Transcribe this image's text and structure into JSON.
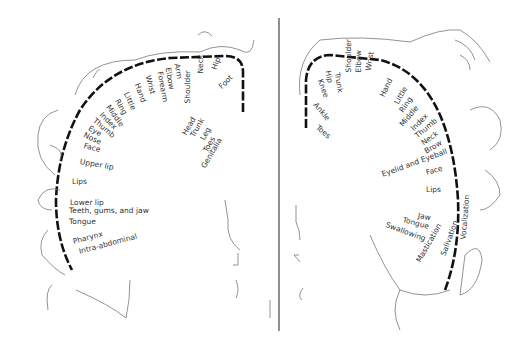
{
  "sensory": {
    "labels": [
      {
        "text": "Genitalia",
        "x": 203,
        "y": 168,
        "rot": -60
      },
      {
        "text": "Toes",
        "x": 205,
        "y": 152,
        "rot": -60
      },
      {
        "text": "Foot",
        "x": 220,
        "y": 88,
        "rot": -45
      },
      {
        "text": "Leg",
        "x": 202,
        "y": 140,
        "rot": -60
      },
      {
        "text": "Hip",
        "x": 214,
        "y": 70,
        "rot": -70
      },
      {
        "text": "Trunk",
        "x": 192,
        "y": 137,
        "rot": -60
      },
      {
        "text": "Neck",
        "x": 200,
        "y": 74,
        "rot": -90
      },
      {
        "text": "Head",
        "x": 184,
        "y": 135,
        "rot": -60
      },
      {
        "text": "Shoulder",
        "x": 187,
        "y": 104,
        "rot": -90
      },
      {
        "text": "Arm",
        "x": 177,
        "y": 64,
        "rot": 80
      },
      {
        "text": "Elbow",
        "x": 168,
        "y": 68,
        "rot": 80
      },
      {
        "text": "Forearm",
        "x": 160,
        "y": 72,
        "rot": 80
      },
      {
        "text": "Wrist",
        "x": 148,
        "y": 76,
        "rot": 75
      },
      {
        "text": "Hand",
        "x": 137,
        "y": 84,
        "rot": 70
      },
      {
        "text": "Little",
        "x": 126,
        "y": 93,
        "rot": 65
      },
      {
        "text": "Ring",
        "x": 117,
        "y": 100,
        "rot": 60
      },
      {
        "text": "Middle",
        "x": 108,
        "y": 106,
        "rot": 55
      },
      {
        "text": "Index",
        "x": 101,
        "y": 114,
        "rot": 45
      },
      {
        "text": "Thumb",
        "x": 94,
        "y": 120,
        "rot": 40
      },
      {
        "text": "Eye",
        "x": 89,
        "y": 128,
        "rot": 30
      },
      {
        "text": "Nose",
        "x": 84,
        "y": 135,
        "rot": 25
      },
      {
        "text": "Face",
        "x": 84,
        "y": 146,
        "rot": 15
      },
      {
        "text": "Upper lip",
        "x": 80,
        "y": 162,
        "rot": 10
      },
      {
        "text": "Lips",
        "x": 72,
        "y": 182,
        "rot": 0
      },
      {
        "text": "Lower lip",
        "x": 70,
        "y": 203,
        "rot": 0
      },
      {
        "text": "Teeth, gums, and jaw",
        "x": 69,
        "y": 211,
        "rot": 0
      },
      {
        "text": "Tongue",
        "x": 69,
        "y": 222,
        "rot": 0
      },
      {
        "text": "Pharynx",
        "x": 73,
        "y": 242,
        "rot": -15
      },
      {
        "text": "Intra-abdominal",
        "x": 79,
        "y": 252,
        "rot": -15
      }
    ]
  },
  "motor": {
    "labels": [
      {
        "text": "Toes",
        "x": 317,
        "y": 127,
        "rot": 40
      },
      {
        "text": "Ankle",
        "x": 315,
        "y": 104,
        "rot": 50
      },
      {
        "text": "Knee",
        "x": 320,
        "y": 80,
        "rot": 70
      },
      {
        "text": "Hip",
        "x": 328,
        "y": 71,
        "rot": 80
      },
      {
        "text": "Trunk",
        "x": 337,
        "y": 73,
        "rot": 80
      },
      {
        "text": "Shoulder",
        "x": 348,
        "y": 73,
        "rot": -90
      },
      {
        "text": "Elbow",
        "x": 358,
        "y": 73,
        "rot": -90
      },
      {
        "text": "Wrist",
        "x": 368,
        "y": 71,
        "rot": -80
      },
      {
        "text": "Hand",
        "x": 382,
        "y": 97,
        "rot": -65
      },
      {
        "text": "Little",
        "x": 396,
        "y": 104,
        "rot": -60
      },
      {
        "text": "Ring",
        "x": 401,
        "y": 112,
        "rot": -55
      },
      {
        "text": "Middle",
        "x": 401,
        "y": 126,
        "rot": -50
      },
      {
        "text": "Index",
        "x": 412,
        "y": 130,
        "rot": -45
      },
      {
        "text": "Thumb",
        "x": 416,
        "y": 137,
        "rot": -40
      },
      {
        "text": "Neck",
        "x": 422,
        "y": 144,
        "rot": -35
      },
      {
        "text": "Brow",
        "x": 425,
        "y": 152,
        "rot": -30
      },
      {
        "text": "Eyelid and Eyeball",
        "x": 382,
        "y": 175,
        "rot": -20
      },
      {
        "text": "Face",
        "x": 426,
        "y": 173,
        "rot": -15
      },
      {
        "text": "Lips",
        "x": 426,
        "y": 190,
        "rot": 0
      },
      {
        "text": "Jaw",
        "x": 418,
        "y": 216,
        "rot": 10
      },
      {
        "text": "Tongue",
        "x": 403,
        "y": 220,
        "rot": 15
      },
      {
        "text": "Swallowing",
        "x": 386,
        "y": 225,
        "rot": 20
      },
      {
        "text": "Mastication",
        "x": 418,
        "y": 262,
        "rot": -60
      },
      {
        "text": "Salivation",
        "x": 443,
        "y": 256,
        "rot": -70
      },
      {
        "text": "Vocalization",
        "x": 463,
        "y": 240,
        "rot": -85
      }
    ]
  }
}
